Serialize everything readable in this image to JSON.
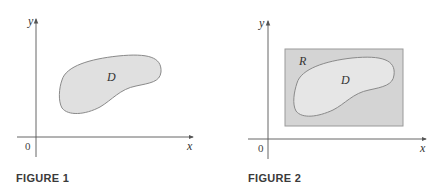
{
  "figures": [
    {
      "caption": "FIGURE 1",
      "axes": {
        "x_label": "x",
        "y_label": "y",
        "origin_label": "0"
      },
      "regions": [
        {
          "label": "D",
          "fill": "#e0e0e0",
          "stroke": "#8a8a8a"
        }
      ]
    },
    {
      "caption": "FIGURE 2",
      "axes": {
        "x_label": "x",
        "y_label": "y",
        "origin_label": "0"
      },
      "regions": [
        {
          "label": "R",
          "shape": "rectangle",
          "fill": "#d4d4d4",
          "stroke": "#9a9a9a"
        },
        {
          "label": "D",
          "fill": "#e6e6e6",
          "stroke": "#8a8a8a"
        }
      ]
    }
  ],
  "colors": {
    "axis": "#555555",
    "text": "#333333"
  }
}
